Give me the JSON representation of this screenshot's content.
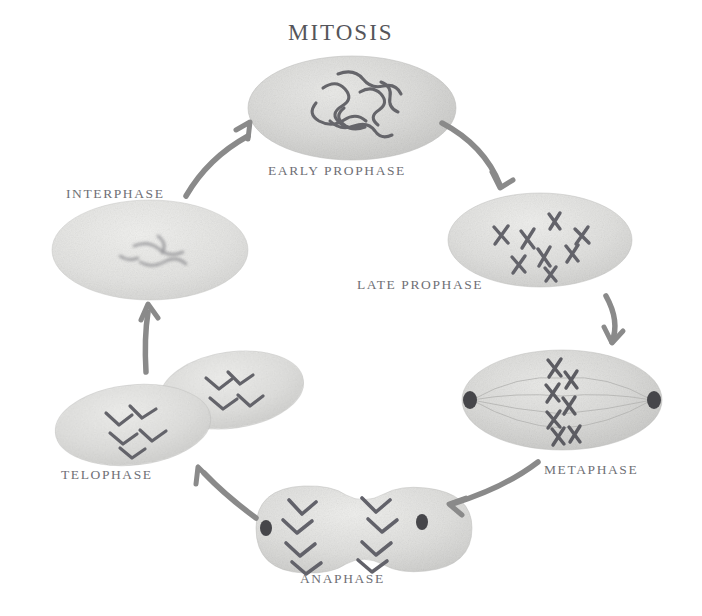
{
  "title": "MITOSIS",
  "background_color": "#ffffff",
  "colors": {
    "title_text": "#55555a",
    "label_text": "#6f7076",
    "cell_body": "#d3d3d1",
    "cell_body_light": "#e2e2e0",
    "chromosome": "#6a6a6e",
    "centrosome": "#4a4a4e",
    "arrow": "#8a8a8a"
  },
  "stages": [
    {
      "id": "early-prophase",
      "label": "EARLY PROPHASE",
      "order": 1,
      "description": "Oval cell with tangled thread-like chromatin condensing in the nucleus",
      "cell_shape": "ellipse",
      "chromosome_form": "tangled-threads",
      "centrosomes_visible": false
    },
    {
      "id": "late-prophase",
      "label": "LATE PROPHASE",
      "order": 2,
      "description": "Oval cell with distinct condensed X-shaped chromosomes scattered throughout",
      "cell_shape": "ellipse",
      "chromosome_form": "x-shaped-scattered",
      "centrosomes_visible": false
    },
    {
      "id": "metaphase",
      "label": "METAPHASE",
      "order": 3,
      "description": "Chromosomes aligned along the cell equator with centrosomes at opposite poles and spindle fibers",
      "cell_shape": "ellipse",
      "chromosome_form": "aligned-equatorial-plate",
      "centrosomes_visible": true
    },
    {
      "id": "anaphase",
      "label": "ANAPHASE",
      "order": 4,
      "description": "Dumbbell shaped cell with V-shaped sister chromatids pulled toward opposite poles",
      "cell_shape": "dumbbell",
      "chromosome_form": "v-shaped-separating",
      "centrosomes_visible": true
    },
    {
      "id": "telophase",
      "label": "TELOPHASE",
      "order": 5,
      "description": "Two daughter cells forming, each with decondensing chromosomes",
      "cell_shape": "two-overlapping-ellipses",
      "chromosome_form": "decondensing",
      "centrosomes_visible": false
    },
    {
      "id": "interphase",
      "label": "INTERPHASE",
      "order": 6,
      "description": "Large oval cell with faint diffuse chromatin, cell growing between divisions",
      "cell_shape": "ellipse",
      "chromosome_form": "diffuse-chromatin",
      "centrosomes_visible": false
    }
  ],
  "arrows": [
    {
      "id": "arrow-early-to-late",
      "from": "early-prophase",
      "to": "late-prophase"
    },
    {
      "id": "arrow-late-to-metaphase",
      "from": "late-prophase",
      "to": "metaphase"
    },
    {
      "id": "arrow-metaphase-to-anaphase",
      "from": "metaphase",
      "to": "anaphase"
    },
    {
      "id": "arrow-anaphase-to-telophase",
      "from": "anaphase",
      "to": "telophase"
    },
    {
      "id": "arrow-telophase-to-interphase",
      "from": "telophase",
      "to": "interphase"
    },
    {
      "id": "arrow-interphase-to-early",
      "from": "interphase",
      "to": "early-prophase"
    }
  ]
}
